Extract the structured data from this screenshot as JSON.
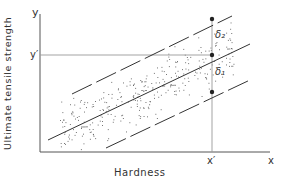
{
  "diagram": {
    "type": "scatter-with-regression-bands",
    "axes": {
      "x_label": "Hardness",
      "y_label": "Ultimate tensile strength",
      "x_end_label": "x",
      "y_end_label": "y",
      "x_marker_label": "x′",
      "y_marker_label": "y′"
    },
    "annotations": {
      "upper_gap": "δ₂",
      "lower_gap": "δ₁"
    },
    "lines": [
      {
        "name": "upper-prediction-limit",
        "style": "dashed"
      },
      {
        "name": "regression-line",
        "style": "solid"
      },
      {
        "name": "lower-prediction-limit",
        "style": "dashed"
      }
    ],
    "colors": {
      "ink": "#333333",
      "guide": "#999999",
      "background": "#ffffff"
    }
  }
}
